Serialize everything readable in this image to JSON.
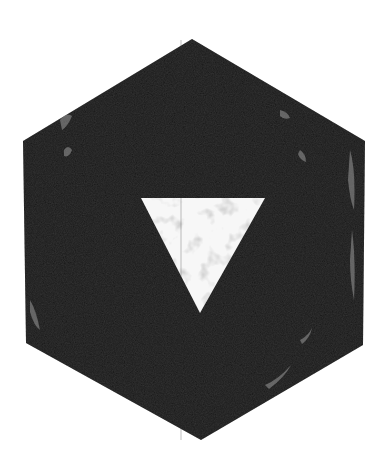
{
  "image": {
    "description": "Distressed black hexagon with a white downward-pointing triangle in the center",
    "background_color": "#ffffff",
    "hexagon": {
      "fill": "#1c1c1c",
      "points": "192,39 365,141 363,345 201,440 26,343 23,141"
    },
    "triangle": {
      "fill": "#f7f7f7",
      "points": "141,198 265,198 200,313"
    },
    "texture_color": "#8a8a8a"
  }
}
